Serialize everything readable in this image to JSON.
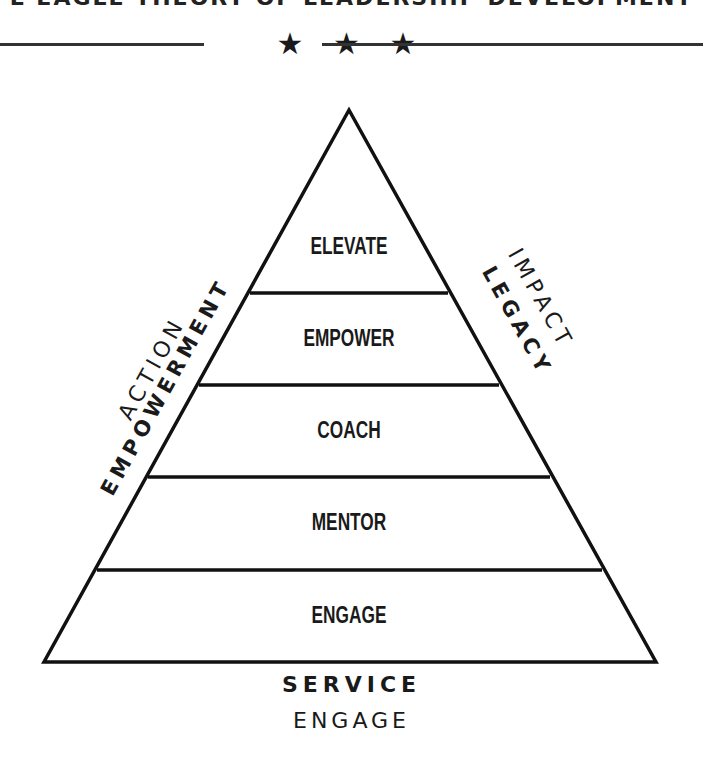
{
  "header": {
    "title_partial": "E EAGLE THEORY OF LEADERSHIP DEVELOPMENT",
    "divider_stars": "★ ★ ★"
  },
  "pyramid": {
    "bands": [
      {
        "label": "ELEVATE"
      },
      {
        "label": "EMPOWER"
      },
      {
        "label": "COACH"
      },
      {
        "label": "MENTOR"
      },
      {
        "label": "ENGAGE"
      }
    ],
    "stroke_color": "#111111",
    "fill_color": "#ffffff"
  },
  "side_labels": {
    "left_top": "ACTION",
    "left_bottom": "EMPOWERMENT",
    "right_top": "IMPACT",
    "right_bottom": "LEGACY"
  },
  "base_labels": {
    "primary": "SERVICE",
    "secondary": "ENGAGE"
  }
}
